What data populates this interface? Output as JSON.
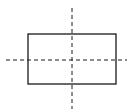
{
  "diagram": {
    "colors": {
      "background": "#ffffff",
      "stroke": "#1a1a1a"
    },
    "rectangle": {
      "x": 28,
      "y": 34,
      "width": 88,
      "height": 50,
      "stroke_width": 1.3
    },
    "axes": {
      "horizontal": {
        "x1": 6,
        "x2": 127,
        "y": 60,
        "dash": "4,3"
      },
      "vertical": {
        "x": 72,
        "y1": 8,
        "y2": 109,
        "dash": "4,3"
      }
    }
  }
}
